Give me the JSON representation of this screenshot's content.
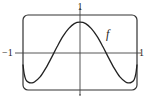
{
  "chart_data": {
    "type": "line",
    "title": "",
    "xlabel": "",
    "ylabel": "",
    "xlim": [
      -1,
      1
    ],
    "ylim": [
      -0.8,
      0.8
    ],
    "grid": false,
    "tick_labels": {
      "y_top": "1",
      "x_left": "−1",
      "x_right": "1"
    },
    "series": [
      {
        "name": "f",
        "x": [
          -1.0,
          -0.98,
          -0.95,
          -0.9,
          -0.85,
          -0.8,
          -0.7,
          -0.6,
          -0.5,
          -0.4,
          -0.3,
          -0.2,
          -0.1,
          0.0,
          0.1,
          0.2,
          0.3,
          0.4,
          0.5,
          0.6,
          0.7,
          0.8,
          0.85,
          0.9,
          0.95,
          0.98,
          1.0
        ],
        "y": [
          -0.25,
          -0.45,
          -0.58,
          -0.64,
          -0.65,
          -0.63,
          -0.52,
          -0.33,
          -0.1,
          0.14,
          0.36,
          0.53,
          0.64,
          0.67,
          0.64,
          0.53,
          0.36,
          0.14,
          -0.1,
          -0.33,
          -0.52,
          -0.63,
          -0.65,
          -0.64,
          -0.58,
          -0.45,
          -0.25
        ]
      }
    ],
    "annotations": [
      {
        "text": "f",
        "x": 0.5,
        "y": 0.4
      }
    ]
  },
  "labels": {
    "y_top": "1",
    "x_left": "−1",
    "x_right": "1",
    "function_name": "f"
  }
}
